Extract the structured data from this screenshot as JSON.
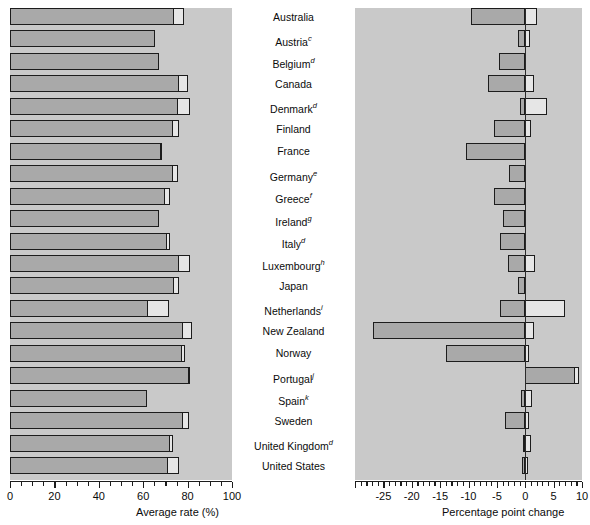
{
  "chart_data": {
    "type": "bar",
    "title": "",
    "panels": [
      {
        "name": "average-rate-panel",
        "xlabel": "Average rate (%)",
        "xlim": [
          0,
          100
        ],
        "xticks": [
          0,
          20,
          40,
          60,
          80,
          100
        ],
        "xticklabels": [
          "0",
          "20",
          "40",
          "60",
          "80",
          "100"
        ],
        "minor_tick_step": 5,
        "grid": false,
        "stacked": true,
        "series": [
          {
            "name": "main-segment",
            "color": "#a9a9a9"
          },
          {
            "name": "light-segment",
            "color": "#e6e6e6"
          }
        ]
      },
      {
        "name": "percentage-point-change-panel",
        "xlabel": "Percentage point change",
        "xlim": [
          -30,
          10
        ],
        "xticks": [
          -30,
          -25,
          -20,
          -15,
          -10,
          -5,
          0,
          5,
          10
        ],
        "xticklabels": [
          "",
          "-25",
          "-20",
          "-15",
          "-10",
          "-5",
          "0",
          "5",
          "10"
        ],
        "minor_tick_step": 1,
        "grid": false,
        "zero_line": 0,
        "series": [
          {
            "name": "main-segment",
            "color": "#a9a9a9"
          },
          {
            "name": "light-segment",
            "color": "#e6e6e6"
          }
        ]
      }
    ],
    "categories": [
      "Australia",
      "Austria",
      "Belgium",
      "Canada",
      "Denmark",
      "Finland",
      "France",
      "Germany",
      "Greece",
      "Ireland",
      "Italy",
      "Luxembourg",
      "Japan",
      "Netherlands",
      "New Zealand",
      "Norway",
      "Portugal",
      "Spain",
      "Sweden",
      "United Kingdom",
      "United States"
    ],
    "category_footnotes": [
      "",
      "c",
      "d",
      "",
      "d",
      "",
      "",
      "e",
      "f",
      "g",
      "d",
      "h",
      "",
      "i",
      "",
      "",
      "j",
      "k",
      "",
      "d",
      ""
    ],
    "rows": [
      {
        "label": "Australia",
        "footnote": "",
        "avg_main": 74.0,
        "avg_light": 78.5,
        "chg_main": -9.5,
        "chg_light": 2.0
      },
      {
        "label": "Austria",
        "footnote": "c",
        "avg_main": 65.5,
        "avg_light": 65.5,
        "chg_main": -1.2,
        "chg_light": 0.8
      },
      {
        "label": "Belgium",
        "footnote": "d",
        "avg_main": 67.0,
        "avg_light": 67.0,
        "chg_main": -4.7,
        "chg_light": 0.0
      },
      {
        "label": "Canada",
        "footnote": "",
        "avg_main": 76.0,
        "avg_light": 80.0,
        "chg_main": -6.5,
        "chg_light": 1.5
      },
      {
        "label": "Denmark",
        "footnote": "d",
        "avg_main": 75.5,
        "avg_light": 81.0,
        "chg_main": -1.0,
        "chg_light": 3.8
      },
      {
        "label": "Finland",
        "footnote": "",
        "avg_main": 73.5,
        "avg_light": 76.0,
        "chg_main": -5.5,
        "chg_light": 1.0
      },
      {
        "label": "France",
        "footnote": "",
        "avg_main": 68.0,
        "avg_light": 68.5,
        "chg_main": -10.5,
        "chg_light": 0.0
      },
      {
        "label": "Germany",
        "footnote": "e",
        "avg_main": 73.5,
        "avg_light": 75.5,
        "chg_main": -2.8,
        "chg_light": 0.0
      },
      {
        "label": "Greece",
        "footnote": "f",
        "avg_main": 70.0,
        "avg_light": 72.0,
        "chg_main": -5.5,
        "chg_light": 0.0
      },
      {
        "label": "Ireland",
        "footnote": "g",
        "avg_main": 67.0,
        "avg_light": 67.0,
        "chg_main": -4.0,
        "chg_light": 0.0
      },
      {
        "label": "Italy",
        "footnote": "d",
        "avg_main": 70.5,
        "avg_light": 72.0,
        "chg_main": -4.5,
        "chg_light": 0.0
      },
      {
        "label": "Luxembourg",
        "footnote": "h",
        "avg_main": 76.0,
        "avg_light": 81.0,
        "chg_main": -3.0,
        "chg_light": 1.8
      },
      {
        "label": "Japan",
        "footnote": "",
        "avg_main": 74.0,
        "avg_light": 76.0,
        "chg_main": -1.3,
        "chg_light": 0.0
      },
      {
        "label": "Netherlands",
        "footnote": "i",
        "avg_main": 62.0,
        "avg_light": 71.5,
        "chg_main": -4.5,
        "chg_light": 7.0
      },
      {
        "label": "New Zealand",
        "footnote": "",
        "avg_main": 78.0,
        "avg_light": 82.0,
        "chg_main": -26.8,
        "chg_light": 1.5
      },
      {
        "label": "Norway",
        "footnote": "",
        "avg_main": 77.5,
        "avg_light": 79.0,
        "chg_main": -14.0,
        "chg_light": 0.6
      },
      {
        "label": "Portugal",
        "footnote": "j",
        "avg_main": 80.5,
        "avg_light": 81.0,
        "chg_main": 8.8,
        "chg_light": 9.5
      },
      {
        "label": "Spain",
        "footnote": "k",
        "avg_main": 61.5,
        "avg_light": 61.5,
        "chg_main": -0.7,
        "chg_light": 1.2
      },
      {
        "label": "Sweden",
        "footnote": "",
        "avg_main": 78.0,
        "avg_light": 80.5,
        "chg_main": -3.5,
        "chg_light": 0.7
      },
      {
        "label": "United Kingdom",
        "footnote": "d",
        "avg_main": 72.0,
        "avg_light": 73.5,
        "chg_main": -0.4,
        "chg_light": 1.0
      },
      {
        "label": "United States",
        "footnote": "",
        "avg_main": 71.0,
        "avg_light": 76.0,
        "chg_main": -0.6,
        "chg_light": 0.5
      }
    ]
  }
}
